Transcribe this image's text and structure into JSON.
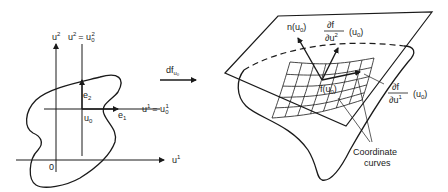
{
  "left_panel": {
    "axis_u2_label": "u",
    "axis_u2_sup": "2",
    "line_u2_eq_label": "u",
    "line_u2_eq_sup": "2",
    "line_u2_eq_rhs": "= u",
    "line_u2_eq_rhs_sub": "0",
    "line_u2_eq_rhs_sup": "2",
    "axis_u1_label": "u",
    "axis_u1_sup": "1",
    "line_u1_eq_label": "u",
    "line_u1_eq_sup": "1",
    "line_u1_eq_rhs": "= u",
    "line_u1_eq_rhs_sub": "0",
    "line_u1_eq_rhs_sup": "1",
    "origin_label": "0",
    "point_label": "u",
    "point_sub": "0",
    "e1_label": "e",
    "e1_sub": "1",
    "e2_label": "e",
    "e2_sub": "2"
  },
  "map_arrow": {
    "label": "df",
    "label_sub": "u₀"
  },
  "right_panel": {
    "normal_label": "n(u",
    "normal_label_sub": "0",
    "normal_label_end": ")",
    "du2_numer": "∂f",
    "du2_denom": "∂u",
    "du2_denom_sup": "2",
    "du2_arg": "(u",
    "du2_arg_sub": "0",
    "du2_arg_end": ")",
    "du1_numer": "∂f",
    "du1_denom": "∂u",
    "du1_denom_sup": "1",
    "du1_arg": "(u",
    "du1_arg_sub": "0",
    "du1_arg_end": ")",
    "point_label": "f(u",
    "point_sub": "0",
    "point_end": ")",
    "coord_curves_line1": "Coordinate",
    "coord_curves_line2": "curves"
  }
}
